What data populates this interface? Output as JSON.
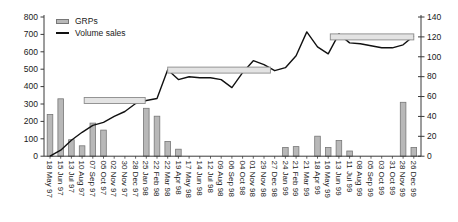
{
  "chart_data": {
    "type": "bar",
    "combo": "bar+line dual axis",
    "title": "",
    "legend_position": "top-left-inside",
    "grid": false,
    "legend": [
      {
        "label": "GRPs",
        "series_type": "bar",
        "color": "#b8b8b8"
      },
      {
        "label": "Volume sales",
        "series_type": "line",
        "color": "#111111"
      }
    ],
    "x_labels": [
      "18 May 97",
      "15 Jun 97",
      "13 Jul 97",
      "10 Aug 97",
      "07 Sep 97",
      "05 Oct 97",
      "02 Nov 97",
      "30 Nov 97",
      "28 Dec 97",
      "25 Jan 98",
      "22 Feb 98",
      "22 Mar 98",
      "19 Apr 98",
      "17 May 98",
      "14 Jun 98",
      "12 Jul 98",
      "09 Aug 98",
      "06 Sep 98",
      "04 Oct 98",
      "01 Nov 98",
      "29 Nov 98",
      "27 Dec 98",
      "24 Jan 99",
      "21 Feb 99",
      "21 Mar 99",
      "18 Apr 99",
      "16 May 99",
      "13 Jun 99",
      "11 Jul 99",
      "08 Aug 99",
      "05 Sep 99",
      "03 Oct 99",
      "31 Oct 99",
      "28 Nov 99",
      "26 Dec 99"
    ],
    "series": [
      {
        "name": "GRPs",
        "type": "bar",
        "axis": "left",
        "values": [
          240,
          330,
          95,
          60,
          190,
          150,
          0,
          0,
          0,
          275,
          230,
          85,
          40,
          0,
          0,
          0,
          0,
          0,
          0,
          0,
          0,
          0,
          50,
          55,
          0,
          115,
          50,
          90,
          30,
          0,
          0,
          0,
          0,
          310,
          50
        ]
      },
      {
        "name": "Volume sales",
        "type": "line",
        "axis": "right",
        "values": [
          0,
          6,
          16,
          24,
          31,
          34,
          40,
          45,
          53,
          56,
          58,
          87,
          77,
          80,
          79,
          79,
          77,
          69,
          84,
          96,
          92,
          86,
          89,
          101,
          125,
          110,
          103,
          123,
          114,
          113,
          111,
          109,
          109,
          112,
          121
        ]
      }
    ],
    "period_bars": [
      {
        "from_index": 3.2,
        "to_index": 8.9,
        "axis": "left",
        "level": 320
      },
      {
        "from_index": 11.0,
        "to_index": 20.6,
        "axis": "left",
        "level": 495
      },
      {
        "from_index": 26.2,
        "to_index": 34.0,
        "axis": "right",
        "level": 120
      }
    ],
    "left_axis": {
      "min": 0,
      "max": 800,
      "step": 100,
      "tick_labels": [
        "0",
        "100",
        "200",
        "300",
        "400",
        "500",
        "600",
        "700",
        "800"
      ]
    },
    "right_axis": {
      "min": 0,
      "max": 140,
      "step": 20,
      "tick_labels": [
        "0",
        "20",
        "40",
        "60",
        "80",
        "100",
        "120",
        "140"
      ]
    }
  },
  "colors": {
    "bar_fill": "#b8b8b8",
    "bar_stroke": "#777777",
    "period_fill": "#e3e3e3",
    "period_stroke": "#8a8a8a",
    "line": "#111111",
    "axis": "#3a3a3a",
    "text": "#1a1a1a",
    "background": "#ffffff"
  }
}
